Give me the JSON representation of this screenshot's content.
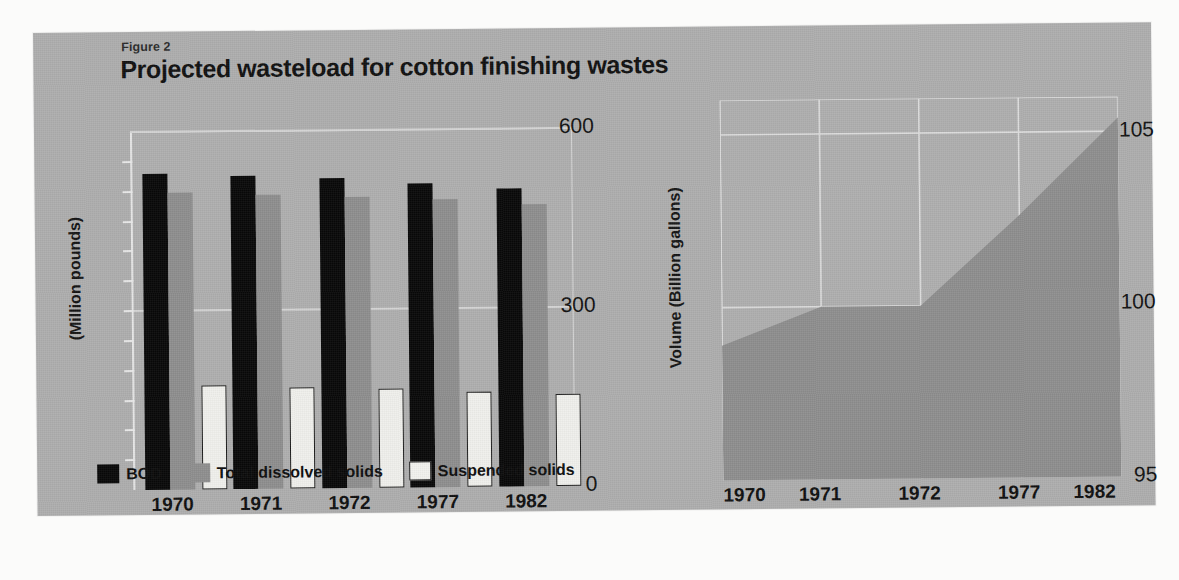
{
  "page": {
    "cut_off_top_text": ""
  },
  "figure": {
    "number_label": "Figure 2",
    "title": "Projected wasteload for cotton finishing wastes",
    "panel_color": "#adadad"
  },
  "legend": {
    "items": [
      {
        "label": "BOD",
        "swatch": "bod",
        "color": "#080808"
      },
      {
        "label": "Total dissolved solids",
        "swatch": "tds",
        "color": "#8e8e8e"
      },
      {
        "label": "Suspended solids",
        "swatch": "ss",
        "color": "#f2f2ee"
      }
    ]
  },
  "chart_data": [
    {
      "id": "wasteload-bars",
      "type": "bar",
      "title": "Projected wasteload for cotton finishing wastes",
      "xlabel": "",
      "ylabel": "(Million pounds)",
      "categories": [
        "1970",
        "1971",
        "1972",
        "1977",
        "1982"
      ],
      "ylim": [
        0,
        600
      ],
      "yticks": [
        0,
        300,
        600
      ],
      "ytick_labels": [
        "0",
        "300",
        "600"
      ],
      "gridlines": true,
      "legend_position": "bottom-left",
      "series": [
        {
          "name": "BOD",
          "color": "#080808",
          "values": [
            530,
            525,
            520,
            510,
            500
          ]
        },
        {
          "name": "Total dissolved solids",
          "color": "#8e8e8e",
          "values": [
            498,
            492,
            488,
            482,
            472
          ]
        },
        {
          "name": "Suspended solids",
          "color": "#f0f0ec",
          "values": [
            175,
            170,
            166,
            160,
            154
          ]
        }
      ]
    },
    {
      "id": "wastewater-volume-area",
      "type": "area",
      "title": "",
      "xlabel": "",
      "ylabel": "Volume (Billion gallons)",
      "x": [
        "1970",
        "1971",
        "1972",
        "1977",
        "1982"
      ],
      "ylim": [
        95,
        106
      ],
      "yticks": [
        95,
        100,
        105
      ],
      "ytick_labels": [
        "95",
        "100",
        "105"
      ],
      "gridlines": true,
      "fill_color": "#8e8e8e",
      "series": [
        {
          "name": "Volume",
          "values": [
            98.9,
            100.0,
            100.0,
            102.6,
            105.4
          ]
        }
      ]
    }
  ]
}
